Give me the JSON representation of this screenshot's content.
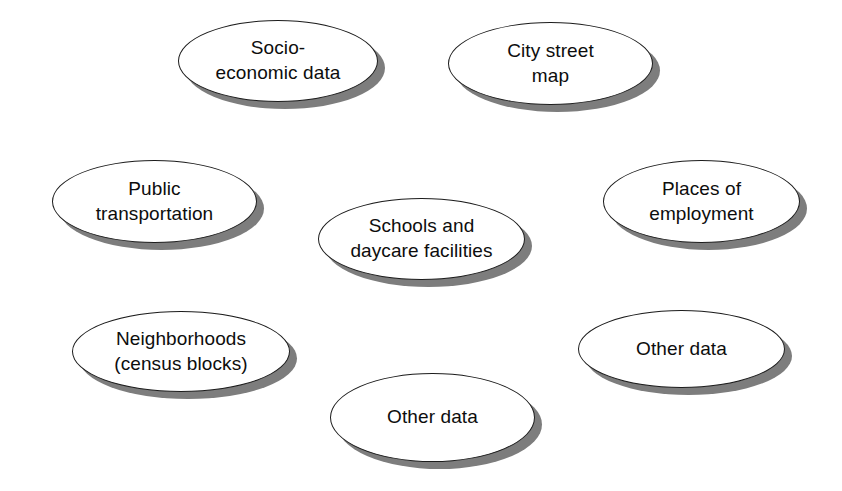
{
  "diagram": {
    "background_color": "#ffffff",
    "node_fill_color": "#ffffff",
    "node_border_color": "#1c1c1c",
    "shadow_color": "#7d7d7d",
    "text_color": "#0d0d0d",
    "shape": "ellipse",
    "node_count": 8,
    "nodes": [
      {
        "id": "socio-economic-data",
        "label": "Socio-\neconomic data",
        "x": 178,
        "y": 20,
        "w": 200,
        "h": 82,
        "font_size": 19,
        "shadow_dx": 7,
        "shadow_dy": 7
      },
      {
        "id": "city-street-map",
        "label": "City street\nmap",
        "x": 448,
        "y": 22,
        "w": 205,
        "h": 83,
        "font_size": 19,
        "shadow_dx": 7,
        "shadow_dy": 7
      },
      {
        "id": "public-transportation",
        "label": "Public\ntransportation",
        "x": 52,
        "y": 160,
        "w": 205,
        "h": 83,
        "font_size": 19,
        "shadow_dx": 7,
        "shadow_dy": 7
      },
      {
        "id": "schools-and-daycare-facilities",
        "label": "Schools and\ndaycare facilities",
        "x": 318,
        "y": 198,
        "w": 207,
        "h": 82,
        "font_size": 19,
        "shadow_dx": 7,
        "shadow_dy": 7
      },
      {
        "id": "places-of-employment",
        "label": "Places of\nemployment",
        "x": 603,
        "y": 160,
        "w": 197,
        "h": 83,
        "font_size": 19,
        "shadow_dx": 7,
        "shadow_dy": 7
      },
      {
        "id": "neighborhoods-census-blocks",
        "label": "Neighborhoods\n(census blocks)",
        "x": 72,
        "y": 311,
        "w": 218,
        "h": 81,
        "font_size": 19,
        "shadow_dx": 7,
        "shadow_dy": 7
      },
      {
        "id": "other-data-right",
        "label": "Other data",
        "x": 578,
        "y": 310,
        "w": 207,
        "h": 78,
        "font_size": 19,
        "shadow_dx": 7,
        "shadow_dy": 7
      },
      {
        "id": "other-data-bottom",
        "label": "Other data",
        "x": 330,
        "y": 373,
        "w": 205,
        "h": 89,
        "font_size": 19,
        "shadow_dx": 7,
        "shadow_dy": 7
      }
    ]
  }
}
